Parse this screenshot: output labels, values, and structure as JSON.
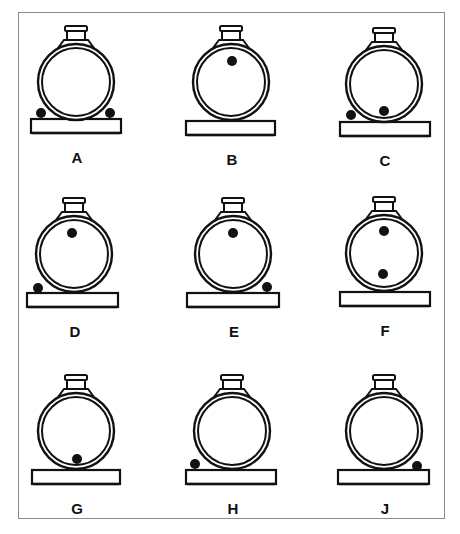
{
  "figure": {
    "type": "multiple-choice tank diagrams",
    "colors": {
      "ink": "#111111",
      "frame": "#8a8a8a",
      "background": "#ffffff"
    }
  },
  "panels": [
    {
      "label": "A",
      "cx": 76,
      "cy": 82,
      "baseY": 119,
      "baseX1": 31,
      "baseX2": 121,
      "dots": [
        {
          "x": 41,
          "y": 113
        },
        {
          "x": 110,
          "y": 113
        }
      ]
    },
    {
      "label": "B",
      "cx": 231,
      "cy": 82,
      "baseY": 121,
      "baseX1": 186,
      "baseX2": 275,
      "dots": [
        {
          "x": 232,
          "y": 61
        }
      ]
    },
    {
      "label": "C",
      "cx": 384,
      "cy": 84,
      "baseY": 122,
      "baseX1": 340,
      "baseX2": 430,
      "dots": [
        {
          "x": 351,
          "y": 115
        },
        {
          "x": 384,
          "y": 111
        }
      ]
    },
    {
      "label": "D",
      "cx": 74,
      "cy": 254,
      "baseY": 293,
      "baseX1": 27,
      "baseX2": 118,
      "dots": [
        {
          "x": 72,
          "y": 233
        },
        {
          "x": 38,
          "y": 288
        }
      ]
    },
    {
      "label": "E",
      "cx": 233,
      "cy": 254,
      "baseY": 293,
      "baseX1": 187,
      "baseX2": 279,
      "dots": [
        {
          "x": 233,
          "y": 233
        },
        {
          "x": 267,
          "y": 287
        }
      ]
    },
    {
      "label": "F",
      "cx": 384,
      "cy": 253,
      "baseY": 292,
      "baseX1": 340,
      "baseX2": 430,
      "dots": [
        {
          "x": 384,
          "y": 231
        },
        {
          "x": 383,
          "y": 274
        }
      ]
    },
    {
      "label": "G",
      "cx": 76,
      "cy": 431,
      "baseY": 470,
      "baseX1": 32,
      "baseX2": 120,
      "dots": [
        {
          "x": 77,
          "y": 459
        }
      ]
    },
    {
      "label": "H",
      "cx": 232,
      "cy": 431,
      "baseY": 470,
      "baseX1": 186,
      "baseX2": 276,
      "dots": [
        {
          "x": 195,
          "y": 464
        }
      ]
    },
    {
      "label": "J",
      "cx": 384,
      "cy": 431,
      "baseY": 470,
      "baseX1": 338,
      "baseX2": 429,
      "dots": [
        {
          "x": 417,
          "y": 466
        }
      ]
    }
  ],
  "geometry": {
    "outerRadius": 38,
    "innerRadius": 34,
    "dotRadius": 5,
    "baseHeight": 14,
    "labelOffset": 34
  }
}
